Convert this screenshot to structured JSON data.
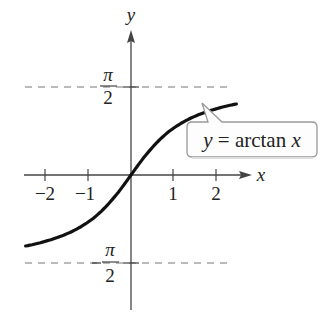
{
  "chart_data": {
    "type": "line",
    "title": "",
    "function": "y = arctan x",
    "xlabel": "x",
    "ylabel": "y",
    "x_ticks": [
      -2,
      -1,
      1,
      2
    ],
    "x_tick_labels": [
      "−2",
      "−1",
      "1",
      "2"
    ],
    "y_tick_labels": [
      {
        "value": 1.5708,
        "num": "π",
        "den": "2",
        "sign": ""
      },
      {
        "value": -1.5708,
        "num": "π",
        "den": "2",
        "sign": "−"
      }
    ],
    "asymptotes": [
      1.5708,
      -1.5708
    ],
    "xlim": [
      -2.45,
      2.45
    ],
    "ylim": [
      -1.5708,
      1.5708
    ],
    "series": [
      {
        "name": "y = arctan x",
        "x": [
          -2.45,
          -2,
          -1.5,
          -1,
          -0.5,
          0,
          0.5,
          1,
          1.5,
          2,
          2.45
        ],
        "y": [
          -1.183,
          -1.107,
          -0.983,
          -0.785,
          -0.464,
          0,
          0.464,
          0.785,
          0.983,
          1.107,
          1.183
        ]
      }
    ],
    "annotation": {
      "text_prefix": "y",
      "text_eq": " = arctan ",
      "text_var": "x"
    },
    "grid": false,
    "legend": "none"
  }
}
